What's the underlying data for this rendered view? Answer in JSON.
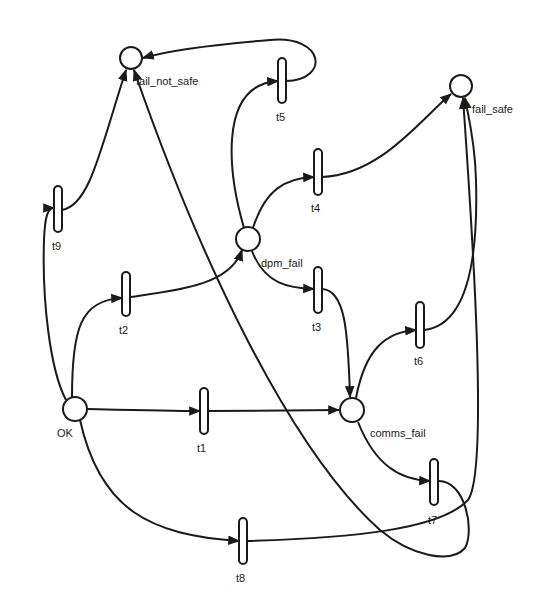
{
  "diagram": {
    "type": "petri-net",
    "colors": {
      "stroke": "#1a1a1a",
      "background": "#ffffff"
    },
    "places": [
      {
        "id": "fail_not_safe",
        "label": "fail_not_safe"
      },
      {
        "id": "fail_safe",
        "label": "fail_safe"
      },
      {
        "id": "dpm_fail",
        "label": "dpm_fail"
      },
      {
        "id": "OK",
        "label": "OK"
      },
      {
        "id": "comms_fail",
        "label": "comms_fail"
      }
    ],
    "transitions": [
      {
        "id": "t1",
        "label": "t1"
      },
      {
        "id": "t2",
        "label": "t2"
      },
      {
        "id": "t3",
        "label": "t3"
      },
      {
        "id": "t4",
        "label": "t4"
      },
      {
        "id": "t5",
        "label": "t5"
      },
      {
        "id": "t6",
        "label": "t6"
      },
      {
        "id": "t7",
        "label": "t7"
      },
      {
        "id": "t8",
        "label": "t8"
      },
      {
        "id": "t9",
        "label": "t9"
      }
    ],
    "arcs": [
      {
        "from": "OK",
        "to": "t1"
      },
      {
        "from": "t1",
        "to": "comms_fail"
      },
      {
        "from": "OK",
        "to": "t2"
      },
      {
        "from": "t2",
        "to": "dpm_fail"
      },
      {
        "from": "OK",
        "to": "t9"
      },
      {
        "from": "t9",
        "to": "fail_not_safe"
      },
      {
        "from": "OK",
        "to": "t8"
      },
      {
        "from": "t8",
        "to": "fail_safe"
      },
      {
        "from": "dpm_fail",
        "to": "t3"
      },
      {
        "from": "t3",
        "to": "comms_fail"
      },
      {
        "from": "dpm_fail",
        "to": "t4"
      },
      {
        "from": "t4",
        "to": "fail_safe"
      },
      {
        "from": "dpm_fail",
        "to": "t5"
      },
      {
        "from": "t5",
        "to": "fail_not_safe"
      },
      {
        "from": "comms_fail",
        "to": "t6"
      },
      {
        "from": "t6",
        "to": "fail_safe"
      },
      {
        "from": "comms_fail",
        "to": "t7"
      },
      {
        "from": "t7",
        "to": "fail_not_safe"
      }
    ]
  }
}
